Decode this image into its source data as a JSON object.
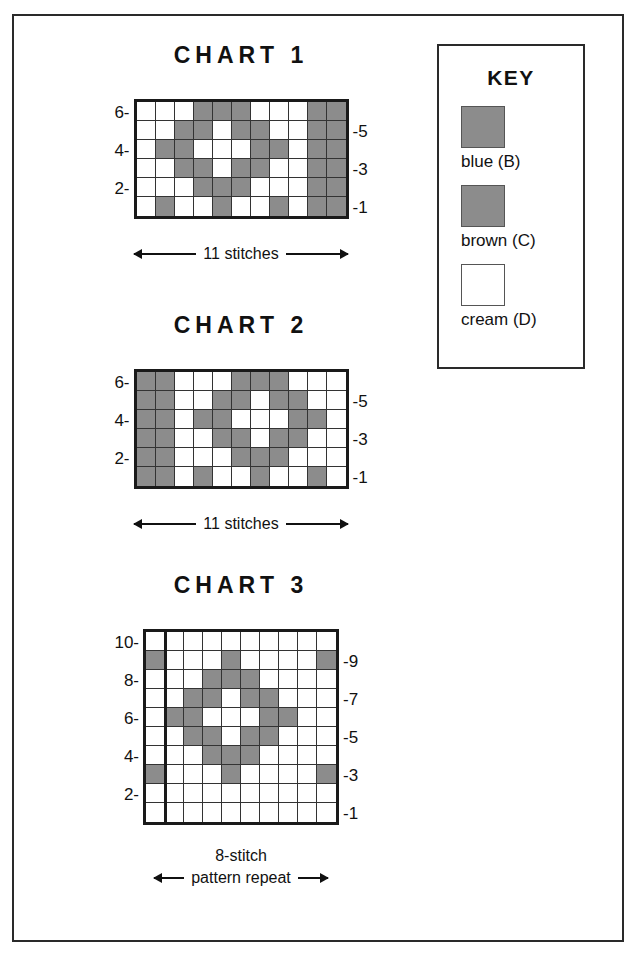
{
  "document": {
    "type": "knitting-colorwork-charts",
    "colors": {
      "filled_cell": "#8c8c8c",
      "empty_cell": "#ffffff",
      "grid_line": "#333333",
      "border": "#1a1a1a"
    }
  },
  "key": {
    "title": "KEY",
    "items": [
      {
        "label": "blue (B)",
        "swatch": "#8c8c8c",
        "symbol": "filled-square"
      },
      {
        "label": "brown (C)",
        "swatch": "#8c8c8c",
        "symbol": "filled-square"
      },
      {
        "label": "cream (D)",
        "swatch": "#ffffff",
        "symbol": "empty-square"
      }
    ]
  },
  "charts": [
    {
      "title": "CHART 1",
      "columns": 11,
      "rows": 6,
      "left_labels": [
        "6-",
        "4-",
        "2-"
      ],
      "right_labels": [
        "-5",
        "-3",
        "-1"
      ],
      "caption_text": "11 stitches",
      "caption_top": "",
      "repeat_after_column": null,
      "chart_data": {
        "type": "heatmap",
        "title": "CHART 1",
        "xlabel": "11 stitches",
        "ylabel": "row",
        "categories": [
          "1",
          "2",
          "3",
          "4",
          "5",
          "6",
          "7",
          "8",
          "9",
          "10",
          "11"
        ],
        "row_labels": [
          "6",
          "5",
          "4",
          "3",
          "2",
          "1"
        ],
        "legend": [
          "filled = blue/brown",
          "empty = cream"
        ],
        "grid": [
          [
            0,
            0,
            0,
            1,
            1,
            1,
            0,
            0,
            0,
            1,
            1
          ],
          [
            0,
            0,
            1,
            1,
            0,
            1,
            1,
            0,
            0,
            1,
            1
          ],
          [
            0,
            1,
            1,
            0,
            0,
            0,
            1,
            1,
            0,
            1,
            1
          ],
          [
            0,
            0,
            1,
            1,
            0,
            1,
            1,
            0,
            0,
            1,
            1
          ],
          [
            0,
            0,
            0,
            1,
            1,
            1,
            0,
            0,
            0,
            1,
            1
          ],
          [
            0,
            1,
            0,
            0,
            1,
            0,
            0,
            1,
            0,
            1,
            1
          ]
        ]
      }
    },
    {
      "title": "CHART 2",
      "columns": 11,
      "rows": 6,
      "left_labels": [
        "6-",
        "4-",
        "2-"
      ],
      "right_labels": [
        "-5",
        "-3",
        "-1"
      ],
      "caption_text": "11 stitches",
      "caption_top": "",
      "repeat_after_column": null,
      "chart_data": {
        "type": "heatmap",
        "title": "CHART 2",
        "xlabel": "11 stitches",
        "ylabel": "row",
        "categories": [
          "1",
          "2",
          "3",
          "4",
          "5",
          "6",
          "7",
          "8",
          "9",
          "10",
          "11"
        ],
        "row_labels": [
          "6",
          "5",
          "4",
          "3",
          "2",
          "1"
        ],
        "legend": [
          "filled = blue/brown",
          "empty = cream"
        ],
        "grid": [
          [
            1,
            1,
            0,
            0,
            0,
            1,
            1,
            1,
            0,
            0,
            0
          ],
          [
            1,
            1,
            0,
            0,
            1,
            1,
            0,
            1,
            1,
            0,
            0
          ],
          [
            1,
            1,
            0,
            1,
            1,
            0,
            0,
            0,
            1,
            1,
            0
          ],
          [
            1,
            1,
            0,
            0,
            1,
            1,
            0,
            1,
            1,
            0,
            0
          ],
          [
            1,
            1,
            0,
            0,
            0,
            1,
            1,
            1,
            0,
            0,
            0
          ],
          [
            1,
            1,
            0,
            1,
            0,
            0,
            1,
            0,
            0,
            1,
            0
          ]
        ]
      }
    },
    {
      "title": "CHART 3",
      "columns": 10,
      "rows": 10,
      "left_labels": [
        "10-",
        "8-",
        "6-",
        "4-",
        "2-"
      ],
      "right_labels": [
        "-9",
        "-7",
        "-5",
        "-3",
        "-1"
      ],
      "caption_text": "pattern repeat",
      "caption_top": "8-stitch",
      "repeat_after_column": 1,
      "chart_data": {
        "type": "heatmap",
        "title": "CHART 3",
        "xlabel": "8-stitch pattern repeat",
        "ylabel": "row",
        "categories": [
          "1",
          "2",
          "3",
          "4",
          "5",
          "6",
          "7",
          "8",
          "9",
          "10"
        ],
        "row_labels": [
          "10",
          "9",
          "8",
          "7",
          "6",
          "5",
          "4",
          "3",
          "2",
          "1"
        ],
        "legend": [
          "filled = blue/brown",
          "empty = cream"
        ],
        "grid": [
          [
            0,
            0,
            0,
            0,
            0,
            0,
            0,
            0,
            0,
            0
          ],
          [
            1,
            0,
            0,
            0,
            1,
            0,
            0,
            0,
            0,
            1
          ],
          [
            0,
            0,
            0,
            1,
            1,
            1,
            0,
            0,
            0,
            0
          ],
          [
            0,
            0,
            1,
            1,
            0,
            1,
            1,
            0,
            0,
            0
          ],
          [
            0,
            1,
            1,
            0,
            0,
            0,
            1,
            1,
            0,
            0
          ],
          [
            0,
            0,
            1,
            1,
            0,
            1,
            1,
            0,
            0,
            0
          ],
          [
            0,
            0,
            0,
            1,
            1,
            1,
            0,
            0,
            0,
            0
          ],
          [
            1,
            0,
            0,
            0,
            1,
            0,
            0,
            0,
            0,
            1
          ],
          [
            0,
            0,
            0,
            0,
            0,
            0,
            0,
            0,
            0,
            0
          ],
          [
            0,
            0,
            0,
            0,
            0,
            0,
            0,
            0,
            0,
            0
          ]
        ]
      }
    }
  ]
}
